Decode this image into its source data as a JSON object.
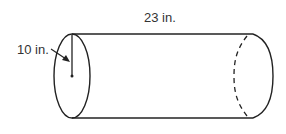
{
  "figure": {
    "shape": "cylinder",
    "radius_label": "10 in.",
    "length_label": "23 in.",
    "stroke_color": "#222222",
    "text_color": "#333333"
  }
}
